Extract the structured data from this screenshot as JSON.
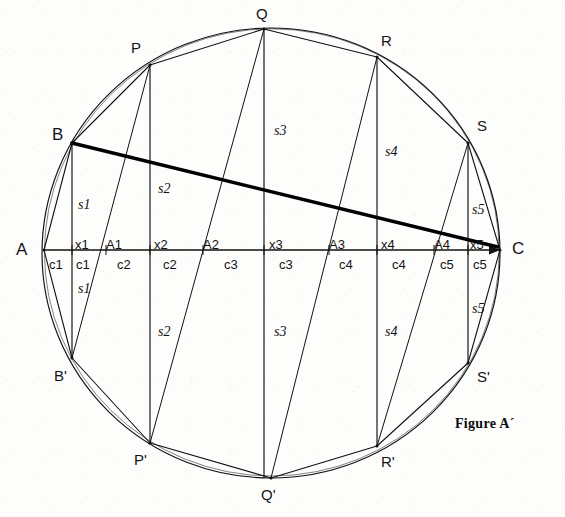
{
  "figure": {
    "caption": "Figure A´",
    "ink_color": "#111111",
    "background_color": "#fdfdfc",
    "chord_color": "#000000"
  },
  "vertices": [
    {
      "id": "A",
      "label": "A",
      "x": 44,
      "y": 250,
      "lx": 16,
      "ly": 241,
      "size": "big"
    },
    {
      "id": "B",
      "label": "B",
      "x": 72,
      "y": 143,
      "lx": 52,
      "ly": 126,
      "size": "big"
    },
    {
      "id": "Bp",
      "label": "B'",
      "x": 72,
      "y": 358,
      "lx": 54,
      "ly": 368,
      "size": "normal"
    },
    {
      "id": "P",
      "label": "P",
      "x": 150,
      "y": 65,
      "lx": 131,
      "ly": 40,
      "size": "normal"
    },
    {
      "id": "Pp",
      "label": "P'",
      "x": 150,
      "y": 443,
      "lx": 134,
      "ly": 452,
      "size": "normal"
    },
    {
      "id": "Q",
      "label": "Q",
      "x": 264,
      "y": 29,
      "lx": 256,
      "ly": 6,
      "size": "normal"
    },
    {
      "id": "Qp",
      "label": "Q'",
      "x": 271,
      "y": 478,
      "lx": 261,
      "ly": 487,
      "size": "normal"
    },
    {
      "id": "R",
      "label": "R",
      "x": 377,
      "y": 57,
      "lx": 381,
      "ly": 33,
      "size": "normal"
    },
    {
      "id": "Rp",
      "label": "R'",
      "x": 377,
      "y": 446,
      "lx": 381,
      "ly": 454,
      "size": "normal"
    },
    {
      "id": "S",
      "label": "S",
      "x": 468,
      "y": 143,
      "lx": 477,
      "ly": 118,
      "size": "normal"
    },
    {
      "id": "Sp",
      "label": "S'",
      "x": 468,
      "y": 363,
      "lx": 477,
      "ly": 369,
      "size": "normal"
    },
    {
      "id": "C",
      "label": "C",
      "x": 500,
      "y": 250,
      "lx": 512,
      "ly": 240,
      "size": "big"
    }
  ],
  "axis_labels": {
    "x_marks": [
      {
        "label": "x1",
        "x": 75,
        "y": 238
      },
      {
        "label": "x2",
        "x": 154,
        "y": 238
      },
      {
        "label": "x3",
        "x": 269,
        "y": 238
      },
      {
        "label": "x4",
        "x": 381,
        "y": 238
      },
      {
        "label": "x5",
        "x": 470,
        "y": 238
      }
    ],
    "a_marks": [
      {
        "label": "A1",
        "x": 106,
        "y": 238
      },
      {
        "label": "A2",
        "x": 203,
        "y": 238
      },
      {
        "label": "A3",
        "x": 329,
        "y": 238
      },
      {
        "label": "A4",
        "x": 434,
        "y": 238
      }
    ],
    "c_marks": [
      {
        "label": "c1",
        "x": 49,
        "y": 258
      },
      {
        "label": "c1",
        "x": 76,
        "y": 258
      },
      {
        "label": "c2",
        "x": 117,
        "y": 258
      },
      {
        "label": "c2",
        "x": 163,
        "y": 258
      },
      {
        "label": "c3",
        "x": 224,
        "y": 258
      },
      {
        "label": "c3",
        "x": 279,
        "y": 258
      },
      {
        "label": "c4",
        "x": 339,
        "y": 258
      },
      {
        "label": "c4",
        "x": 392,
        "y": 258
      },
      {
        "label": "c5",
        "x": 440,
        "y": 258
      },
      {
        "label": "c5",
        "x": 473,
        "y": 258
      }
    ]
  },
  "chord_labels": [
    {
      "label": "s1",
      "x": 78,
      "y": 198
    },
    {
      "label": "s1",
      "x": 78,
      "y": 282
    },
    {
      "label": "s2",
      "x": 158,
      "y": 182
    },
    {
      "label": "s2",
      "x": 158,
      "y": 325
    },
    {
      "label": "s3",
      "x": 274,
      "y": 124
    },
    {
      "label": "s3",
      "x": 274,
      "y": 325
    },
    {
      "label": "s4",
      "x": 385,
      "y": 145
    },
    {
      "label": "s4",
      "x": 385,
      "y": 325
    },
    {
      "label": "s5",
      "x": 472,
      "y": 203
    },
    {
      "label": "s5",
      "x": 472,
      "y": 302
    }
  ],
  "geometry": {
    "circle": {
      "cx": 271,
      "cy": 253,
      "rx": 229,
      "ry": 225
    },
    "baseline": {
      "x1": 44,
      "y1": 250,
      "x2": 500,
      "y2": 250
    },
    "thick_chord": {
      "x1": 72,
      "y1": 143,
      "x2": 498,
      "y2": 247,
      "width": 3.4
    },
    "verticals": [
      {
        "x": 72,
        "ytop": 143,
        "ybot": 358
      },
      {
        "x": 150,
        "ytop": 65,
        "ybot": 443
      },
      {
        "x": 264,
        "ytop": 29,
        "ybot": 478
      },
      {
        "x": 377,
        "ytop": 57,
        "ybot": 446
      },
      {
        "x": 468,
        "ytop": 143,
        "ybot": 363
      }
    ],
    "upper_polygon": "44,250 72,143 150,65 264,29 377,57 468,143 500,250",
    "lower_polygon": "44,250 72,358 150,443 271,478 377,446 468,363 500,250",
    "fan_from_upper": [
      {
        "x1": 150,
        "y1": 65,
        "x2": 72,
        "y2": 358
      },
      {
        "x1": 264,
        "y1": 29,
        "x2": 150,
        "y2": 443
      },
      {
        "x1": 377,
        "y1": 57,
        "x2": 271,
        "y2": 478
      },
      {
        "x1": 468,
        "y1": 143,
        "x2": 377,
        "y2": 446
      }
    ],
    "axis_ticks_upper": [
      {
        "x": 72,
        "y": 250
      },
      {
        "x": 106,
        "y": 250
      },
      {
        "x": 150,
        "y": 250
      },
      {
        "x": 203,
        "y": 250
      },
      {
        "x": 264,
        "y": 250
      },
      {
        "x": 329,
        "y": 250
      },
      {
        "x": 377,
        "y": 250
      },
      {
        "x": 434,
        "y": 250
      },
      {
        "x": 468,
        "y": 250
      }
    ],
    "arrow_head": {
      "x": 500,
      "y": 250
    }
  },
  "caption_pos": {
    "x": 455,
    "y": 417
  }
}
